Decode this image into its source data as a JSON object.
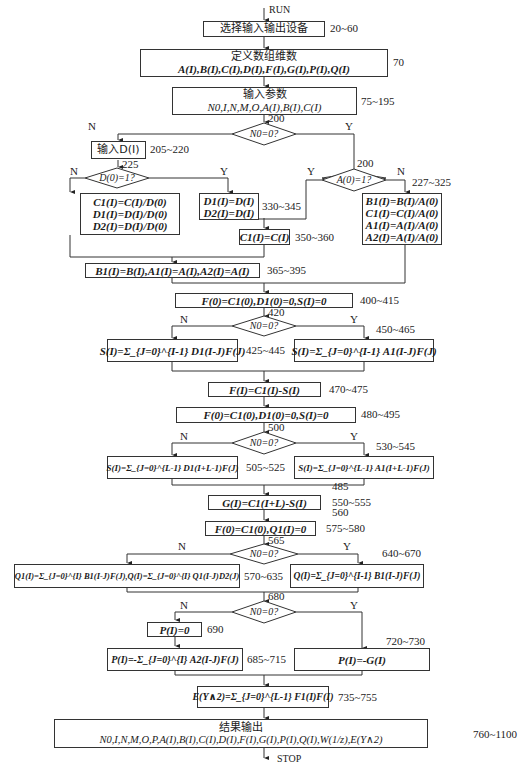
{
  "start": "RUN",
  "end": "STOP",
  "nodes": {
    "select_io": {
      "text": "选择输入输出设备",
      "line": "20~60"
    },
    "define_arrays": {
      "title": "定义数组维数",
      "text": "A(I),B(I),C(I),D(I),F(I),G(I),P(I),Q(I)",
      "line": "70"
    },
    "input_params": {
      "title": "输入参数",
      "text": "N0,I,N,M,O,A(I),B(I),C(I)",
      "line": "75~195"
    },
    "dec1": {
      "text": "N0=0?",
      "line": "200",
      "no": "N",
      "yes": "Y"
    },
    "input_d": {
      "text": "输入D(I)",
      "line": "205~220"
    },
    "dec_d0": {
      "text": "D(0)=1?",
      "line": "225",
      "no": "N",
      "yes": "Y"
    },
    "norm_d": {
      "lines": [
        "C1(I)=C(I)/D(0)",
        "D1(I)=D(I)/D(0)",
        "D2(I)=D(I)/D(0)"
      ]
    },
    "copy_d": {
      "lines": [
        "D1(I)=D(I)",
        "D2(I)=D(I)"
      ],
      "line": "330~345"
    },
    "copy_c": {
      "text": "C1(I)=C(I)",
      "line": "350~360"
    },
    "dec_a0": {
      "text": "A(0)=1?",
      "line": "200",
      "no": "N",
      "yes": "Y"
    },
    "norm_a": {
      "lines": [
        "B1(I)=B(I)/A(0)",
        "C1(I)=C(I)/A(0)",
        "A1(I)=A(I)/A(0)",
        "A2(I)=A(I)/A(0)"
      ],
      "line": "227~325"
    },
    "copy_bA": {
      "text": "B1(I)=B(I),A1(I)=A(I),A2(I)=A(I)",
      "line": "365~395"
    },
    "init1": {
      "text": "F(0)=C1(0),D1(0)=0,S(I)=0",
      "line": "400~415"
    },
    "dec2": {
      "text": "N0=0?",
      "line": "420",
      "no": "N",
      "yes": "Y"
    },
    "s_d1": {
      "text": "S(I)=Σ_{J=0}^{I-1} D1(I-J)F(J)",
      "line": "425~445"
    },
    "s_a1": {
      "text": "S(I)=Σ_{J=0}^{I-1} A1(I-J)F(J)",
      "line": "450~465"
    },
    "f_calc": {
      "text": "F(I)=C1(I)-S(I)",
      "line": "470~475"
    },
    "init2": {
      "text": "F(0)=C1(0),D1(0)=0,S(I)=0",
      "line": "480~495"
    },
    "dec3": {
      "text": "N0=0?",
      "line": "500",
      "no": "N",
      "yes": "Y"
    },
    "s_d1L": {
      "text": "S(I)=Σ_{J=0}^{L-1} D1(I+L-1)F(J)",
      "line": "505~525"
    },
    "s_a1L": {
      "text": "S(I)=Σ_{J=0}^{L-1} A1(I+L-1)F(J)",
      "line": "530~545"
    },
    "g_calc": {
      "text": "G(I)=C1(I+L)-S(I)",
      "line_top": "485",
      "line": "550~555"
    },
    "init3": {
      "text": "F(0)=C1(0),Q1(I)=0",
      "line_top": "560",
      "line": "575~580"
    },
    "dec4": {
      "text": "N0=0?",
      "line": "565",
      "no": "N",
      "yes": "Y"
    },
    "q_n": {
      "text": "Q1(I)=Σ_{J=0}^{I} B1(I-J)F(J),Q(I)=Σ_{J=0}^{I} Q1(I-J)D2(J)",
      "line": "570~635"
    },
    "q_y": {
      "text": "Q(I)=Σ_{J=0}^{I-1} B1(I-J)F(J)",
      "line": "640~670"
    },
    "dec5": {
      "text": "N0=0?",
      "line": "680",
      "no": "N",
      "yes": "Y"
    },
    "p_zero": {
      "text": "P(I)=0",
      "line": "690"
    },
    "p_sum": {
      "text": "P(I)=-Σ_{J=0}^{I} A2(I-J)F(J)",
      "line": "685~715"
    },
    "p_neg_g": {
      "text": "P(I)=-G(I)",
      "line": "720~730"
    },
    "e_calc": {
      "text": "E(Y∧2)=Σ_{J=0}^{L-1} F1(I)F(I)",
      "line": "735~755"
    },
    "output": {
      "title": "结果输出",
      "text": "N0,I,N,M,O,P,A(I),B(I),C(I),D(I),F(I),G(I),P(I),Q(I),W(1/z),E(Y∧2)",
      "line": "760~1100"
    }
  }
}
